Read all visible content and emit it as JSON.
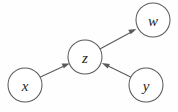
{
  "diagram": {
    "type": "node-link-graph",
    "background_color": "#fefefe",
    "node_fill_color": "#ffffff",
    "node_stroke_color": "#5a5a5a",
    "edge_color": "#5a5a5a",
    "label_color": "#1f1f1f",
    "nodes": [
      {
        "id": "x",
        "label": "x",
        "cx": 25,
        "cy": 85,
        "r": 17
      },
      {
        "id": "z",
        "label": "z",
        "cx": 85,
        "cy": 57,
        "r": 17
      },
      {
        "id": "w",
        "label": "w",
        "cx": 153,
        "cy": 20,
        "r": 17
      },
      {
        "id": "y",
        "label": "y",
        "cx": 146,
        "cy": 85,
        "r": 17
      }
    ],
    "edges": [
      {
        "id": "x-to-z",
        "from": "x",
        "to": "z",
        "label": "",
        "directed": true
      },
      {
        "id": "z-to-w",
        "from": "z",
        "to": "w",
        "label": "",
        "directed": true
      },
      {
        "id": "y-to-z",
        "from": "y",
        "to": "z",
        "label": "",
        "directed": true
      }
    ]
  }
}
